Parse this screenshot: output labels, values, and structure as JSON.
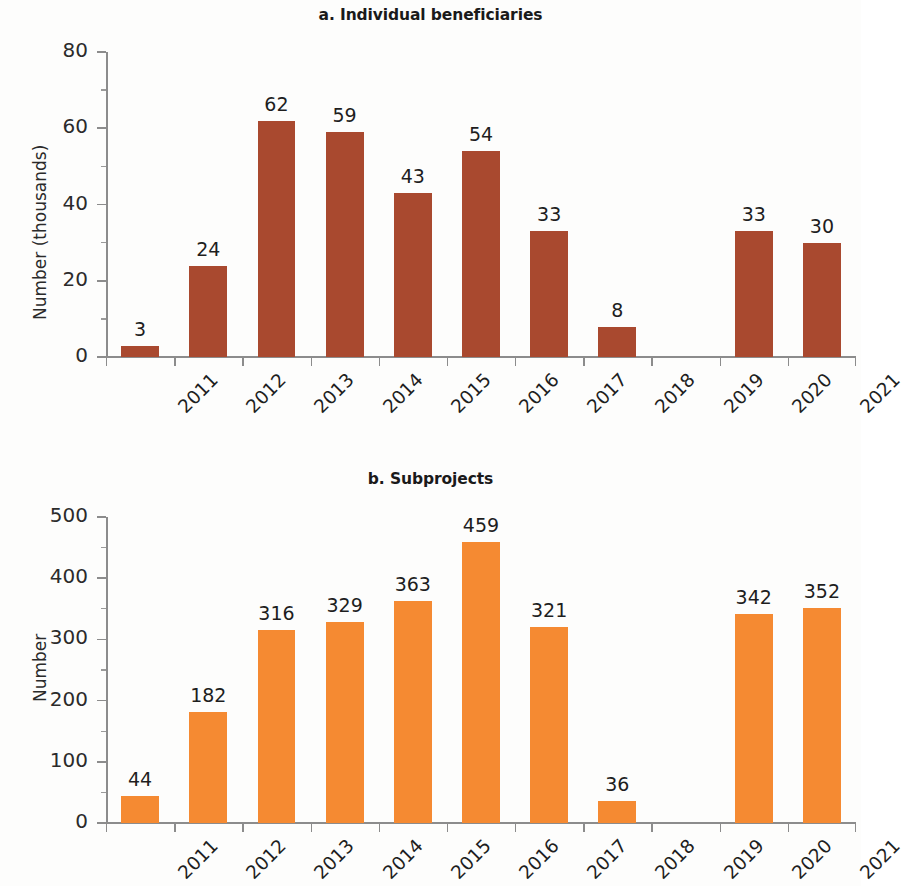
{
  "figure": {
    "background": "#fdfdfc",
    "panels": [
      {
        "id": "a",
        "title": "a. Individual beneficiaries",
        "ylabel": "Number (thousands)",
        "bar_color": "#A9492F"
      },
      {
        "id": "b",
        "title": "b. Subprojects",
        "ylabel": "Number",
        "bar_color": "#F58A32"
      }
    ]
  },
  "chart_data": [
    {
      "type": "bar",
      "title": "a. Individual beneficiaries",
      "xlabel": "",
      "ylabel": "Number (thousands)",
      "categories": [
        "2011",
        "2012",
        "2013",
        "2014",
        "2015",
        "2016",
        "2017",
        "2018",
        "2019",
        "2020",
        "2021"
      ],
      "values": [
        3,
        24,
        62,
        59,
        43,
        54,
        33,
        8,
        null,
        33,
        30
      ],
      "value_labels": [
        "3",
        "24",
        "62",
        "59",
        "43",
        "54",
        "33",
        "8",
        "",
        "33",
        "30"
      ],
      "ylim": [
        0,
        80
      ],
      "yticks": [
        0,
        20,
        40,
        60,
        80
      ],
      "ytick_labels": [
        "0",
        "20",
        "40",
        "60",
        "80"
      ],
      "y_minor_interval": 10,
      "grid": false,
      "legend": null,
      "bar_color": "#A9492F",
      "xtick_rotation": -45
    },
    {
      "type": "bar",
      "title": "b. Subprojects",
      "xlabel": "",
      "ylabel": "Number",
      "categories": [
        "2011",
        "2012",
        "2013",
        "2014",
        "2015",
        "2016",
        "2017",
        "2018",
        "2019",
        "2020",
        "2021"
      ],
      "values": [
        44,
        182,
        316,
        329,
        363,
        459,
        321,
        36,
        null,
        342,
        352
      ],
      "value_labels": [
        "44",
        "182",
        "316",
        "329",
        "363",
        "459",
        "321",
        "36",
        "",
        "342",
        "352"
      ],
      "ylim": [
        0,
        500
      ],
      "yticks": [
        0,
        100,
        200,
        300,
        400,
        500
      ],
      "ytick_labels": [
        "0",
        "100",
        "200",
        "300",
        "400",
        "500"
      ],
      "y_minor_interval": 50,
      "grid": false,
      "legend": null,
      "bar_color": "#F58A32",
      "xtick_rotation": -45
    }
  ]
}
